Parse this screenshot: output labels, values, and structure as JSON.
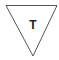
{
  "symbol": {
    "shape": "inverted-triangle",
    "label": "T",
    "stroke_color": "#555555",
    "fill_color": "#ffffff",
    "text_color": "#222222"
  }
}
